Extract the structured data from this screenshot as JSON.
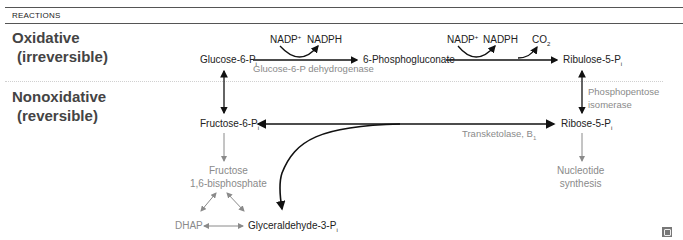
{
  "header": {
    "title": "REACTIONS"
  },
  "sections": {
    "oxidative": {
      "line1": "Oxidative",
      "line2": "(irreversible)"
    },
    "nonoxidative": {
      "line1": "Nonoxidative",
      "line2": "(reversible)"
    }
  },
  "nodes": {
    "glucose6p": "Glucose-6-P",
    "phosphogluconate": "6-Phosphogluconate",
    "ribulose5p": "Ribulose-5-P",
    "fructose6p": "Fructose-6-P",
    "ribose5p": "Ribose-5-P",
    "fructose16bp_1": "Fructose",
    "fructose16bp_2": "1,6-bisphosphate",
    "nucleotide_1": "Nucleotide",
    "nucleotide_2": "synthesis",
    "dhap": "DHAP",
    "g3p": "Glyceraldehyde-3-P",
    "subscript_i": "i"
  },
  "cofactors": {
    "nadp1": "NADP",
    "nadph1": "NADPH",
    "nadp2": "NADP",
    "nadph2": "NADPH",
    "co2": "CO",
    "co2_sub": "2",
    "plus": "+"
  },
  "enzymes": {
    "g6pd": "Glucose-6-P dehydrogenase",
    "isomerase_1": "Phosphopentose",
    "isomerase_2": "isomerase",
    "transketolase": "Transketolase, B",
    "transketolase_sub": "1"
  },
  "colors": {
    "main": "#111111",
    "secondary": "#8a8a8a",
    "rule": "#555555"
  }
}
